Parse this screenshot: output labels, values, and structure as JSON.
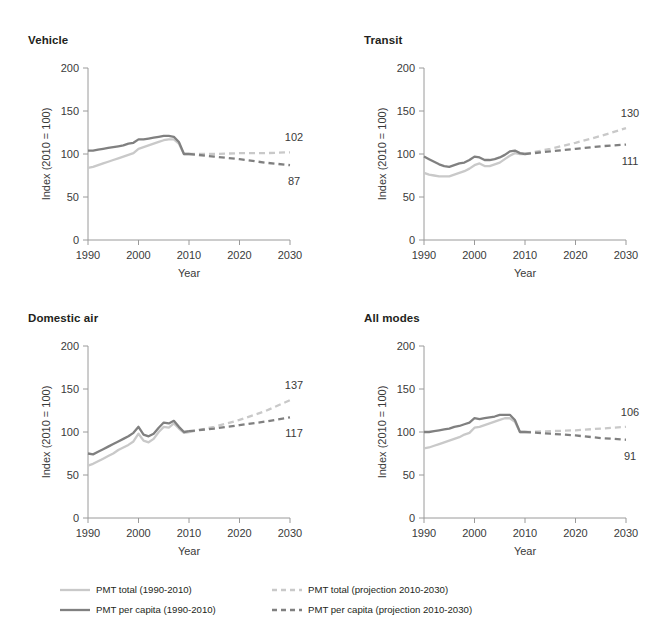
{
  "figure": {
    "background": "#ffffff",
    "text_color": "#231f20",
    "colors": {
      "pmt_total": "#c9c9c9",
      "pmt_per_capita": "#808080",
      "axis": "#9a9a9a",
      "tick_label": "#3a3a3a"
    }
  },
  "legend": {
    "position": "bottom",
    "items": [
      {
        "label": "PMT total (1990-2010)",
        "color": "#c9c9c9",
        "style": "solid",
        "name": "pmt-total-historical"
      },
      {
        "label": "PMT total (projection 2010-2030)",
        "color": "#c9c9c9",
        "style": "dashed",
        "name": "pmt-total-projection"
      },
      {
        "label": "PMT per capita (1990-2010)",
        "color": "#808080",
        "style": "solid",
        "name": "pmt-per-capita-historical"
      },
      {
        "label": "PMT per capita (projection 2010-2030)",
        "color": "#808080",
        "style": "dashed",
        "name": "pmt-per-capita-projection"
      }
    ]
  },
  "chart_data": [
    {
      "type": "line",
      "title": "Vehicle",
      "xlabel": "Year",
      "ylabel": "Index (2010 = 100)",
      "xlim": [
        1990,
        2030
      ],
      "ylim": [
        0,
        200
      ],
      "xticks": [
        1990,
        2000,
        2010,
        2020,
        2030
      ],
      "yticks": [
        0,
        50,
        100,
        150,
        200
      ],
      "grid": false,
      "end_labels": [
        {
          "text": "102",
          "series": "PMT total (projection 2010-2030)",
          "value": 102
        },
        {
          "text": "87",
          "series": "PMT per capita (projection 2010-2030)",
          "value": 87
        }
      ],
      "series": [
        {
          "name": "PMT total (1990-2010)",
          "style": "solid",
          "color": "#c9c9c9",
          "x": [
            1990,
            1991,
            1992,
            1993,
            1994,
            1995,
            1996,
            1997,
            1998,
            1999,
            2000,
            2001,
            2002,
            2003,
            2004,
            2005,
            2006,
            2007,
            2008,
            2009,
            2010
          ],
          "values": [
            84,
            85,
            87,
            89,
            91,
            93,
            95,
            97,
            99,
            101,
            106,
            108,
            110,
            112,
            114,
            116,
            117,
            117,
            112,
            100,
            100
          ]
        },
        {
          "name": "PMT per capita (1990-2010)",
          "style": "solid",
          "color": "#808080",
          "x": [
            1990,
            1991,
            1992,
            1993,
            1994,
            1995,
            1996,
            1997,
            1998,
            1999,
            2000,
            2001,
            2002,
            2003,
            2004,
            2005,
            2006,
            2007,
            2008,
            2009,
            2010
          ],
          "values": [
            104,
            104,
            105,
            106,
            107,
            108,
            109,
            110,
            112,
            113,
            117,
            117,
            118,
            119,
            120,
            121,
            121,
            120,
            114,
            100,
            100
          ]
        },
        {
          "name": "PMT total (projection 2010-2030)",
          "style": "dashed",
          "color": "#c9c9c9",
          "x": [
            2010,
            2015,
            2020,
            2025,
            2030
          ],
          "values": [
            100,
            100,
            101,
            101,
            102
          ]
        },
        {
          "name": "PMT per capita (projection 2010-2030)",
          "style": "dashed",
          "color": "#808080",
          "x": [
            2010,
            2015,
            2020,
            2025,
            2030
          ],
          "values": [
            100,
            97,
            94,
            90,
            87
          ]
        }
      ]
    },
    {
      "type": "line",
      "title": "Transit",
      "xlabel": "Year",
      "ylabel": "Index (2010 = 100)",
      "xlim": [
        1990,
        2030
      ],
      "ylim": [
        0,
        200
      ],
      "xticks": [
        1990,
        2000,
        2010,
        2020,
        2030
      ],
      "yticks": [
        0,
        50,
        100,
        150,
        200
      ],
      "grid": false,
      "end_labels": [
        {
          "text": "130",
          "series": "PMT total (projection 2010-2030)",
          "value": 130
        },
        {
          "text": "111",
          "series": "PMT per capita (projection 2010-2030)",
          "value": 111
        }
      ],
      "series": [
        {
          "name": "PMT total (1990-2010)",
          "style": "solid",
          "color": "#c9c9c9",
          "x": [
            1990,
            1991,
            1992,
            1993,
            1994,
            1995,
            1996,
            1997,
            1998,
            1999,
            2000,
            2001,
            2002,
            2003,
            2004,
            2005,
            2006,
            2007,
            2008,
            2009,
            2010
          ],
          "values": [
            78,
            76,
            75,
            74,
            74,
            74,
            76,
            78,
            80,
            83,
            87,
            89,
            86,
            86,
            88,
            90,
            94,
            98,
            101,
            100,
            100
          ]
        },
        {
          "name": "PMT per capita (1990-2010)",
          "style": "solid",
          "color": "#808080",
          "x": [
            1990,
            1991,
            1992,
            1993,
            1994,
            1995,
            1996,
            1997,
            1998,
            1999,
            2000,
            2001,
            2002,
            2003,
            2004,
            2005,
            2006,
            2007,
            2008,
            2009,
            2010
          ],
          "values": [
            97,
            94,
            91,
            88,
            86,
            85,
            87,
            89,
            90,
            93,
            97,
            96,
            93,
            93,
            94,
            96,
            99,
            103,
            104,
            101,
            100
          ]
        },
        {
          "name": "PMT total (projection 2010-2030)",
          "style": "dashed",
          "color": "#c9c9c9",
          "x": [
            2010,
            2015,
            2020,
            2025,
            2030
          ],
          "values": [
            100,
            106,
            113,
            121,
            130
          ]
        },
        {
          "name": "PMT per capita (projection 2010-2030)",
          "style": "dashed",
          "color": "#808080",
          "x": [
            2010,
            2015,
            2020,
            2025,
            2030
          ],
          "values": [
            100,
            103,
            106,
            109,
            111
          ]
        }
      ]
    },
    {
      "type": "line",
      "title": "Domestic air",
      "xlabel": "Year",
      "ylabel": "Index (2010 = 100)",
      "xlim": [
        1990,
        2030
      ],
      "ylim": [
        0,
        200
      ],
      "xticks": [
        1990,
        2000,
        2010,
        2020,
        2030
      ],
      "yticks": [
        0,
        50,
        100,
        150,
        200
      ],
      "grid": false,
      "end_labels": [
        {
          "text": "137",
          "series": "PMT total (projection 2010-2030)",
          "value": 137
        },
        {
          "text": "117",
          "series": "PMT per capita (projection 2010-2030)",
          "value": 117
        }
      ],
      "series": [
        {
          "name": "PMT total (1990-2010)",
          "style": "solid",
          "color": "#c9c9c9",
          "x": [
            1990,
            1991,
            1992,
            1993,
            1994,
            1995,
            1996,
            1997,
            1998,
            1999,
            2000,
            2001,
            2002,
            2003,
            2004,
            2005,
            2006,
            2007,
            2008,
            2009,
            2010
          ],
          "values": [
            61,
            63,
            66,
            69,
            72,
            75,
            79,
            82,
            85,
            89,
            98,
            90,
            88,
            92,
            100,
            106,
            105,
            110,
            104,
            99,
            100
          ]
        },
        {
          "name": "PMT per capita (1990-2010)",
          "style": "solid",
          "color": "#808080",
          "x": [
            1990,
            1991,
            1992,
            1993,
            1994,
            1995,
            1996,
            1997,
            1998,
            1999,
            2000,
            2001,
            2002,
            2003,
            2004,
            2005,
            2006,
            2007,
            2008,
            2009,
            2010
          ],
          "values": [
            75,
            74,
            77,
            80,
            83,
            86,
            89,
            92,
            95,
            99,
            106,
            97,
            95,
            98,
            105,
            111,
            110,
            113,
            106,
            100,
            101
          ]
        },
        {
          "name": "PMT total (projection 2010-2030)",
          "style": "dashed",
          "color": "#c9c9c9",
          "x": [
            2010,
            2015,
            2020,
            2025,
            2030
          ],
          "values": [
            100,
            106,
            114,
            124,
            137
          ]
        },
        {
          "name": "PMT per capita (projection 2010-2030)",
          "style": "dashed",
          "color": "#808080",
          "x": [
            2010,
            2015,
            2020,
            2025,
            2030
          ],
          "values": [
            101,
            104,
            108,
            112,
            117
          ]
        }
      ]
    },
    {
      "type": "line",
      "title": "All modes",
      "xlabel": "Year",
      "ylabel": "Index (2010 = 100)",
      "xlim": [
        1990,
        2030
      ],
      "ylim": [
        0,
        200
      ],
      "xticks": [
        1990,
        2000,
        2010,
        2020,
        2030
      ],
      "yticks": [
        0,
        50,
        100,
        150,
        200
      ],
      "grid": false,
      "end_labels": [
        {
          "text": "106",
          "series": "PMT total (projection 2010-2030)",
          "value": 106
        },
        {
          "text": "91",
          "series": "PMT per capita (projection 2010-2030)",
          "value": 91
        }
      ],
      "series": [
        {
          "name": "PMT total (1990-2010)",
          "style": "solid",
          "color": "#c9c9c9",
          "x": [
            1990,
            1991,
            1992,
            1993,
            1994,
            1995,
            1996,
            1997,
            1998,
            1999,
            2000,
            2001,
            2002,
            2003,
            2004,
            2005,
            2006,
            2007,
            2008,
            2009,
            2010
          ],
          "values": [
            81,
            82,
            84,
            86,
            88,
            90,
            92,
            94,
            97,
            99,
            105,
            106,
            108,
            110,
            112,
            114,
            116,
            116,
            112,
            100,
            100
          ]
        },
        {
          "name": "PMT per capita (1990-2010)",
          "style": "solid",
          "color": "#808080",
          "x": [
            1990,
            1991,
            1992,
            1993,
            1994,
            1995,
            1996,
            1997,
            1998,
            1999,
            2000,
            2001,
            2002,
            2003,
            2004,
            2005,
            2006,
            2007,
            2008,
            2009,
            2010
          ],
          "values": [
            100,
            100,
            101,
            102,
            103,
            104,
            106,
            107,
            109,
            111,
            116,
            115,
            116,
            117,
            118,
            120,
            120,
            120,
            114,
            100,
            100
          ]
        },
        {
          "name": "PMT total (projection 2010-2030)",
          "style": "dashed",
          "color": "#c9c9c9",
          "x": [
            2010,
            2015,
            2020,
            2025,
            2030
          ],
          "values": [
            100,
            101,
            102,
            104,
            106
          ]
        },
        {
          "name": "PMT per capita (projection 2010-2030)",
          "style": "dashed",
          "color": "#808080",
          "x": [
            2010,
            2015,
            2020,
            2025,
            2030
          ],
          "values": [
            100,
            98,
            96,
            93,
            91
          ]
        }
      ]
    }
  ]
}
